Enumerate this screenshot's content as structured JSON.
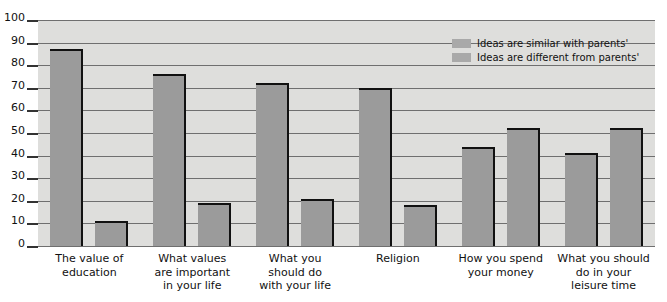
{
  "chart_data": {
    "type": "bar",
    "title": "",
    "subtitle": "",
    "xlabel": "",
    "ylabel": "",
    "ylim": [
      0,
      100
    ],
    "yticks": [
      0,
      10,
      20,
      30,
      40,
      50,
      60,
      70,
      80,
      90,
      100
    ],
    "grid": true,
    "legend_position": "top-right",
    "categories": [
      "The value of education",
      "What values are important in your life",
      "What you should do with your life",
      "Religion",
      "How you spend your money",
      "What you should do in your leisure time"
    ],
    "category_lines": [
      [
        "The value of",
        "education"
      ],
      [
        "What values",
        "are important",
        "in your life"
      ],
      [
        "What you",
        "should do",
        "with your life"
      ],
      [
        "Religion"
      ],
      [
        "How you spend",
        "your money"
      ],
      [
        "What you should",
        "do in your",
        "leisure time"
      ]
    ],
    "series": [
      {
        "name": "Ideas are similar with parents'",
        "color": "#9b9b9b",
        "values": [
          87,
          76,
          72,
          70,
          44,
          41
        ]
      },
      {
        "name": "Ideas are different from parents'",
        "color": "#9b9b9b",
        "values": [
          11,
          19,
          21,
          18,
          52,
          52
        ]
      }
    ]
  },
  "legend": {
    "items": [
      {
        "label": "Ideas are similar with parents'",
        "swatch_color": "#a9a9a9"
      },
      {
        "label": "Ideas are different from parents'",
        "swatch_color": "#a9a9a9"
      }
    ]
  },
  "colors": {
    "plot_background": "#dededc",
    "bar_fill": "#9b9b9b",
    "bar_outline": "#111111",
    "gridline": "#6f6f6f",
    "text": "#111111",
    "page_background": "#ffffff"
  }
}
